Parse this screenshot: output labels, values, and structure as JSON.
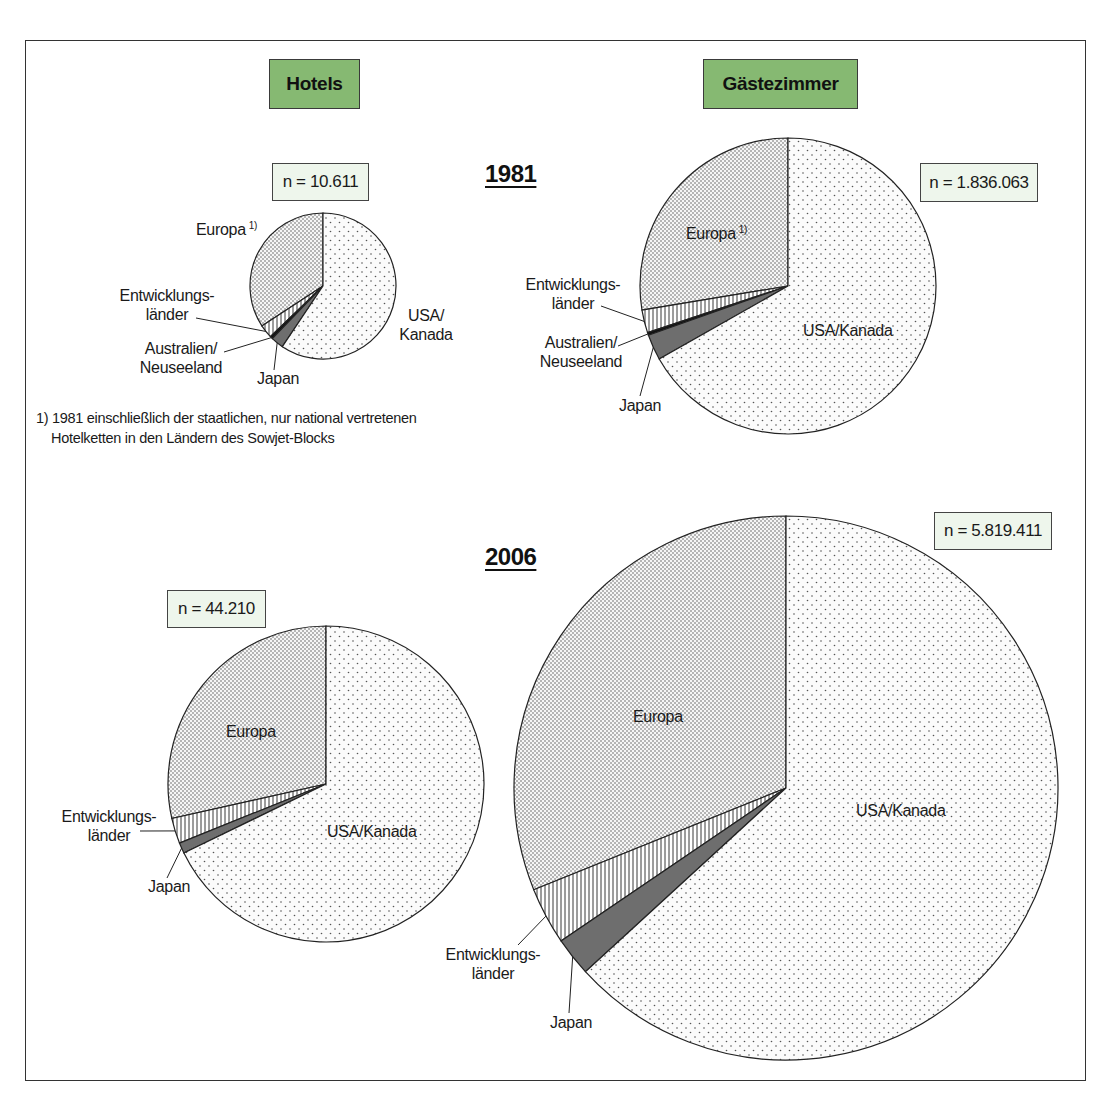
{
  "headers": {
    "hotels": "Hotels",
    "rooms": "Gästezimmer"
  },
  "years": {
    "y1981": "1981",
    "y2006": "2006"
  },
  "footnote": {
    "line1": "1) 1981 einschließlich der staatlichen, nur national vertretenen",
    "line2": "Hotelketten in den Ländern des Sowjet-Blocks"
  },
  "footnote_marker": "1)",
  "labels": {
    "europa": "Europa",
    "usa_kanada": "USA/Kanada",
    "usa_line1": "USA/",
    "kanada_line2": "Kanada",
    "entw_line1": "Entwicklungs-",
    "entw_line2": "länder",
    "aus_line1": "Australien/",
    "aus_line2": "Neuseeland",
    "japan": "Japan"
  },
  "colors": {
    "header_green": "#86b972",
    "n_box_bg": "#eef6ec",
    "japan_fill": "#6e6e6e",
    "outline": "#222222"
  },
  "chart_data": [
    {
      "type": "pie",
      "title": "Hotels 1981",
      "n_label": "n = 10.611",
      "n": 10611,
      "categories": [
        "Europa 1)",
        "Entwicklungsländer",
        "Australien/Neuseeland",
        "Japan",
        "USA/Kanada"
      ],
      "values": [
        34.2,
        3.0,
        0.6,
        2.8,
        59.4
      ],
      "unit": "% (estimated from slice angles)",
      "geometry": {
        "cx": 323,
        "cy": 286,
        "r": 73
      }
    },
    {
      "type": "pie",
      "title": "Gästezimmer 1981",
      "n_label": "n = 1.836.063",
      "n": 1836063,
      "categories": [
        "Europa 1)",
        "Entwicklungsländer",
        "Australien/Neuseeland",
        "Japan",
        "USA/Kanada"
      ],
      "values": [
        27.6,
        2.5,
        0.3,
        2.8,
        66.8
      ],
      "unit": "% (estimated from slice angles)",
      "geometry": {
        "cx": 788,
        "cy": 286,
        "r": 148
      }
    },
    {
      "type": "pie",
      "title": "Hotels 2006",
      "n_label": "n = 44.210",
      "n": 44210,
      "categories": [
        "Europa",
        "Entwicklungsländer",
        "Japan",
        "USA/Kanada"
      ],
      "values": [
        28.5,
        2.6,
        1.1,
        67.8
      ],
      "unit": "% (estimated from slice angles)",
      "geometry": {
        "cx": 326,
        "cy": 784,
        "r": 158
      }
    },
    {
      "type": "pie",
      "title": "Gästezimmer 2006",
      "n_label": "n = 5.819.411",
      "n": 5819411,
      "categories": [
        "Europa",
        "Entwicklungsländer",
        "Japan",
        "USA/Kanada"
      ],
      "values": [
        31.1,
        3.4,
        2.3,
        63.2
      ],
      "unit": "% (estimated from slice angles)",
      "geometry": {
        "cx": 786,
        "cy": 788,
        "r": 272
      }
    }
  ]
}
